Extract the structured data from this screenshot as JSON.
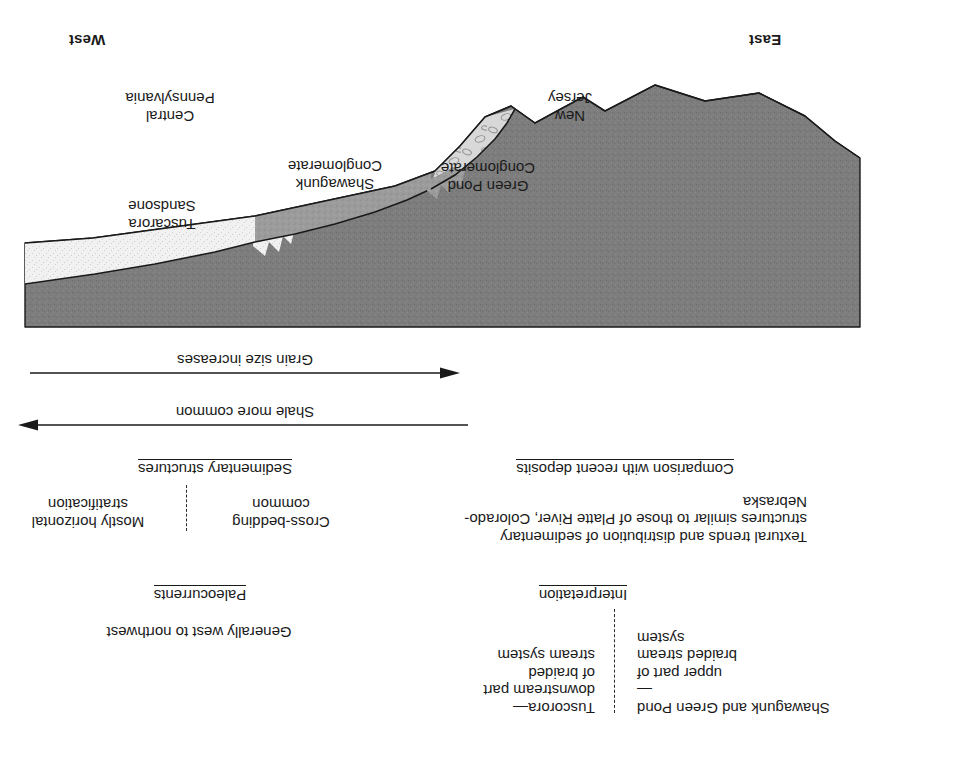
{
  "figure": {
    "kind": "geologic-cross-section",
    "orientation_note": "rotated-180",
    "direction_left": "East",
    "direction_right": "West"
  },
  "sections": {
    "interpretation": {
      "title": "Interpretation",
      "left_column": [
        "Shawagunk and Green Pond—",
        "upper part of",
        "braided stream",
        "system"
      ],
      "right_column": [
        "Tuscorora—",
        "downstream part",
        "of braided",
        "stream system"
      ],
      "divider": "dashed"
    },
    "comparison": {
      "title": "Comparison with recent deposits",
      "lines": [
        "Textural trends and distribution of sedimentary",
        "structures similar to those of Platte River, Colorado-",
        "Nebraska"
      ]
    },
    "paleocurrents": {
      "title": "Paleocurrents",
      "text": "Generally west to northwest"
    },
    "sedimentary_structures": {
      "title": "Sedimentary structures",
      "left_column": [
        "Cross-bedding",
        "common"
      ],
      "right_column": [
        "Mostly horizontal",
        "stratification"
      ],
      "divider": "dashed"
    }
  },
  "trend_arrows": [
    {
      "label": "Shale more common",
      "direction": "left"
    },
    {
      "label": "Grain size increases",
      "direction": "right"
    }
  ],
  "cross_section": {
    "place_labels": [
      {
        "text_lines": [
          "New",
          "Jersey"
        ]
      },
      {
        "text_lines": [
          "Central",
          "Pennsylvania"
        ]
      }
    ],
    "units": [
      {
        "name": "Green Pond Conglomerate",
        "lines": [
          "Green Pond",
          "Conglomerate"
        ],
        "fill": "#d8d8d8",
        "pattern": "pebble"
      },
      {
        "name": "Shawagunk Conglomerate",
        "lines": [
          "Shawagunk",
          "Conglomerate"
        ],
        "fill": "#9b9b9b",
        "pattern": "stipple-medium"
      },
      {
        "name": "Tuscarora Sandstone",
        "lines": [
          "Tuscarora",
          "Sandsone"
        ],
        "fill": "#f1f1f1",
        "pattern": "stipple-fine"
      },
      {
        "name": "Overlying shale",
        "lines": [],
        "fill": "#7d7d7d",
        "pattern": "stipple-dark"
      }
    ]
  },
  "colors": {
    "shale_dark": "#7d7d7d",
    "conglomerate_medium": "#9b9b9b",
    "green_pond_light": "#d8d8d8",
    "sandstone_light": "#f1f1f1",
    "outline": "#1a1a1a",
    "text": "#1a1a1a",
    "background": "#ffffff"
  }
}
